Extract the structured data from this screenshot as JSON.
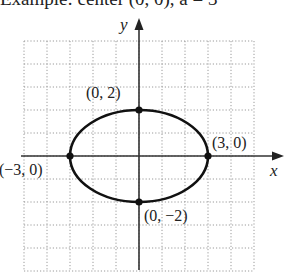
{
  "header": {
    "cropped_text": "Example: center (0, 0), a = 3"
  },
  "chart_data": {
    "type": "line",
    "title": "",
    "xlabel": "x",
    "ylabel": "y",
    "xlim": [
      -5,
      5
    ],
    "ylim": [
      -5,
      5
    ],
    "grid": true,
    "grid_style": "dotted",
    "curve": {
      "shape": "ellipse",
      "center": [
        0,
        0
      ],
      "a": 3,
      "b": 2,
      "equation": "x^2/9 + y^2/4 = 1"
    },
    "points": [
      {
        "x": 0,
        "y": 2,
        "label": "(0, 2)"
      },
      {
        "x": 3,
        "y": 0,
        "label": "(3, 0)"
      },
      {
        "x": -3,
        "y": 0,
        "label": "(−3, 0)"
      },
      {
        "x": 0,
        "y": -2,
        "label": "(0, −2)"
      }
    ],
    "colors": {
      "curve": "#111111",
      "axes": "#333333",
      "grid": "#9a9a9a"
    }
  }
}
